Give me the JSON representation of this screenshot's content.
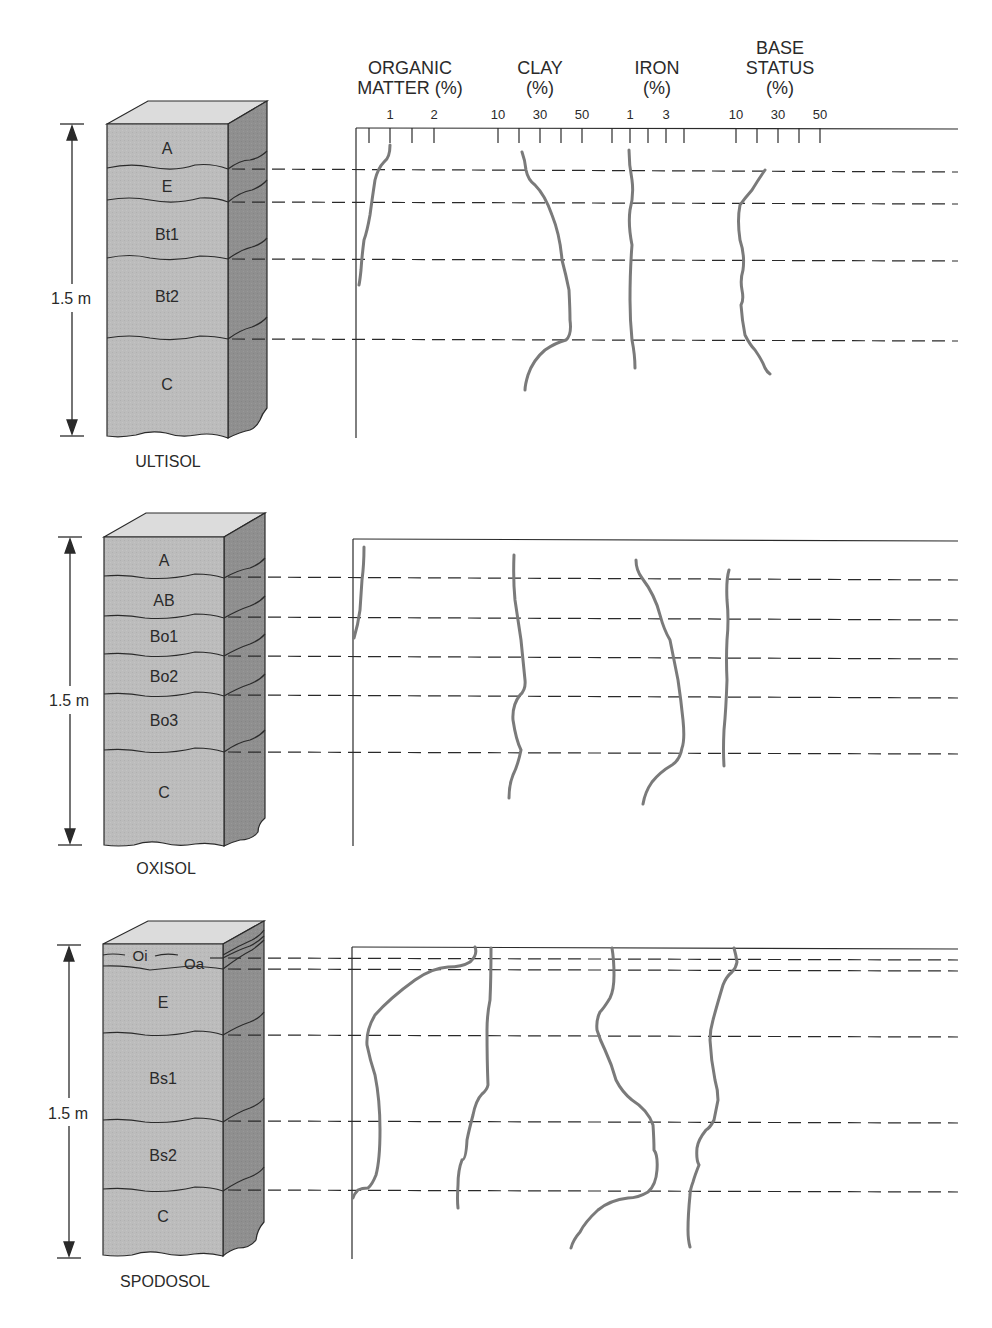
{
  "headers": {
    "organic_matter": {
      "line1": "ORGANIC",
      "line2": "MATTER (%)"
    },
    "clay": {
      "line1": "CLAY",
      "line2": "(%)"
    },
    "iron": {
      "line1": "IRON",
      "line2": "(%)"
    },
    "base_status": {
      "line1": "BASE",
      "line2": "STATUS",
      "line3": "(%)"
    }
  },
  "tick_labels": [
    {
      "text": "1",
      "x": 390
    },
    {
      "text": "2",
      "x": 434
    },
    {
      "text": "10",
      "x": 498
    },
    {
      "text": "30",
      "x": 540
    },
    {
      "text": "50",
      "x": 582
    },
    {
      "text": "1",
      "x": 630
    },
    {
      "text": "3",
      "x": 666
    },
    {
      "text": "10",
      "x": 736
    },
    {
      "text": "30",
      "x": 778
    },
    {
      "text": "50",
      "x": 820
    }
  ],
  "depth_label": "1.5 m",
  "colors": {
    "front_face": "#b9b9b9",
    "side_face": "#8e8e8e",
    "top_face": "#dcdcdc",
    "curve": "#7a7a7a",
    "line": "#2a2a2a"
  },
  "profiles": [
    {
      "name": "ULTISOL",
      "horizons": [
        {
          "label": "A",
          "y": 148
        },
        {
          "label": "E",
          "y": 186
        },
        {
          "label": "Bt1",
          "y": 234
        },
        {
          "label": "Bt2",
          "y": 296
        },
        {
          "label": "C",
          "y": 384
        }
      ]
    },
    {
      "name": "OXISOL",
      "horizons": [
        {
          "label": "A",
          "y": 560
        },
        {
          "label": "AB",
          "y": 600
        },
        {
          "label": "Bo1",
          "y": 636
        },
        {
          "label": "Bo2",
          "y": 676
        },
        {
          "label": "Bo3",
          "y": 720
        },
        {
          "label": "C",
          "y": 792
        }
      ]
    },
    {
      "name": "SPODOSOL",
      "horizons": [
        {
          "label": "Oi",
          "y": 955
        },
        {
          "label": "Oa",
          "y": 963
        },
        {
          "label": "E",
          "y": 1002
        },
        {
          "label": "Bs1",
          "y": 1078
        },
        {
          "label": "Bs2",
          "y": 1155
        },
        {
          "label": "C",
          "y": 1216
        }
      ]
    }
  ],
  "chart_data": {
    "type": "line",
    "xlabel": "",
    "ylabel": "Depth (0–1.5 m)",
    "variables": [
      "Organic matter (%)",
      "Clay (%)",
      "Iron (%)",
      "Base status (%)"
    ],
    "axis_ticks": {
      "organic_matter": [
        "1",
        "2"
      ],
      "clay": [
        "10",
        "30",
        "50"
      ],
      "iron": [
        "1",
        "3"
      ],
      "base_status": [
        "10",
        "30",
        "50"
      ]
    },
    "profiles": [
      {
        "name": "Ultisol",
        "horizons": [
          "A",
          "E",
          "Bt1",
          "Bt2",
          "C"
        ],
        "series": [
          {
            "name": "Organic matter",
            "trend": "~1% at surface decreasing to ~0 in Bt2"
          },
          {
            "name": "Clay",
            "trend": "~20% at surface increasing to ~45% in Bt2, decreasing to ~20% in C"
          },
          {
            "name": "Iron",
            "trend": "~1% roughly constant with depth"
          },
          {
            "name": "Base status",
            "trend": "~25% in E, ~10–15% in Bt, ~25% in C"
          }
        ]
      },
      {
        "name": "Oxisol",
        "horizons": [
          "A",
          "AB",
          "Bo1",
          "Bo2",
          "Bo3",
          "C"
        ],
        "series": [
          {
            "name": "Organic matter",
            "trend": "~0.5% in A decreasing to ~0 in Bo1"
          },
          {
            "name": "Clay",
            "trend": "~20–30% roughly constant with depth"
          },
          {
            "name": "Iron",
            "trend": "~1% at surface increasing to ~4% in Bo3, decreasing in C"
          },
          {
            "name": "Base status",
            "trend": "~3–5% roughly constant"
          }
        ]
      },
      {
        "name": "Spodosol",
        "horizons": [
          "Oi",
          "Oa",
          "E",
          "Bs1",
          "Bs2",
          "C"
        ],
        "series": [
          {
            "name": "Organic matter",
            "trend": "high in Oi/Oa, minimal in E, ~0.5% in Bs, ~0 in C"
          },
          {
            "name": "Clay",
            "trend": "~10% near-constant, slight decrease with depth"
          },
          {
            "name": "Iron",
            "trend": "~1% in E, increasing to ~3% in Bs2, decreasing in C"
          },
          {
            "name": "Base status",
            "trend": "~15% in O, decreasing to ~10% in E/Bs, lower in C"
          }
        ]
      }
    ]
  }
}
